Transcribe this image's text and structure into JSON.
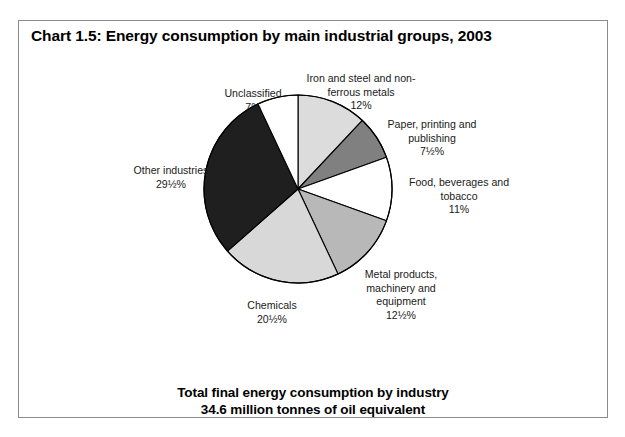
{
  "page": {
    "top_cut_text": "",
    "background": "#ffffff"
  },
  "chart_frame": {
    "title": "Chart 1.5:  Energy consumption by main industrial groups, 2003",
    "border_color": "#8b8b8b"
  },
  "footer": {
    "line1": "Total final energy consumption by industry",
    "line2": "34.6 million tonnes of oil equivalent"
  },
  "labels": {
    "unclassified": {
      "name": "Unclassified",
      "pct": "7%"
    },
    "iron_steel": {
      "name": "Iron and steel and non-\nferrous metals",
      "pct": "12%"
    },
    "paper": {
      "name": "Paper, printing and\npublishing",
      "pct": "7½%"
    },
    "food": {
      "name": "Food, beverages and\ntobacco",
      "pct": "11%"
    },
    "metal_products": {
      "name": "Metal products,\nmachinery and\nequipment",
      "pct": "12½%"
    },
    "chemicals": {
      "name": "Chemicals",
      "pct": "20½%"
    },
    "other_industries": {
      "name": "Other industries",
      "pct": "29½%"
    }
  },
  "chart_data": {
    "type": "pie",
    "title": "Chart 1.5:  Energy consumption by main industrial groups, 2003",
    "subtitle": "Total final energy consumption by industry 34.6 million tonnes of oil equivalent",
    "total_value": 34.6,
    "total_units": "million tonnes of oil equivalent",
    "legend": "none (direct labels)",
    "start_angle_deg": 0,
    "direction": "clockwise",
    "categories": [
      "Iron and steel and non-ferrous metals",
      "Paper, printing and publishing",
      "Food, beverages and tobacco",
      "Metal products, machinery and equipment",
      "Chemicals",
      "Other industries",
      "Unclassified"
    ],
    "values": [
      12,
      7.5,
      11,
      12.5,
      20.5,
      29.5,
      7
    ],
    "value_labels": [
      "12%",
      "7½%",
      "11%",
      "12½%",
      "20½%",
      "29½%",
      "7%"
    ],
    "colors": [
      "#dcdcdc",
      "#808080",
      "#ffffff",
      "#b8b8b8",
      "#d8d8d8",
      "#1f1f1f",
      "#ffffff"
    ],
    "slice_border_color": "#000000",
    "units": "percent of total"
  }
}
